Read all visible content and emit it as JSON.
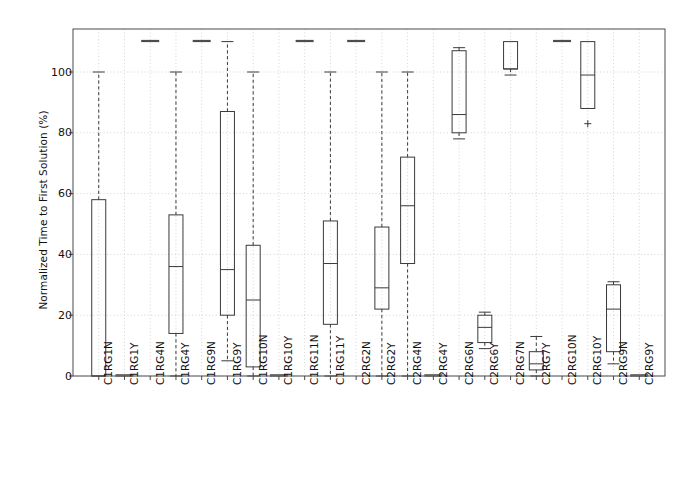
{
  "chart_data": {
    "type": "box",
    "title": "",
    "xlabel": "",
    "ylabel": "Normalized Time to First Solution (%)",
    "ylim": [
      -6,
      114
    ],
    "yticks": [
      0,
      20,
      40,
      60,
      80,
      100
    ],
    "ytick_labels": [
      "0",
      "20",
      "40",
      "60",
      "80",
      "100"
    ],
    "grid": true,
    "legend": "none",
    "categories": [
      "C1RG1N",
      "C1RG1Y",
      "C1RG4N",
      "C1RG4Y",
      "C1RG9N",
      "C1RG9Y",
      "C1RG10N",
      "C1RG10Y",
      "C1RG11N",
      "C1RG11Y",
      "C2RG2N",
      "C2RG2Y",
      "C2RG4N",
      "C2RG4Y",
      "C2RG6N",
      "C2RG6Y",
      "C2RG7N",
      "C2RG7Y",
      "C2RG10N",
      "C2RG10Y",
      "C2RG9N",
      "C2RG9Y"
    ],
    "boxes": [
      {
        "label": "C1RG1N",
        "whisker_low": 0,
        "q1": 0,
        "median": 0,
        "q3": 58,
        "whisker_high": 100,
        "fliers": []
      },
      {
        "label": "C1RG1Y",
        "whisker_low": 0,
        "q1": 0,
        "median": 0,
        "q3": 0,
        "whisker_high": 0,
        "fliers": []
      },
      {
        "label": "C1RG4N",
        "whisker_low": 110,
        "q1": 110,
        "median": 110,
        "q3": 110,
        "whisker_high": 110,
        "fliers": []
      },
      {
        "label": "C1RG4Y",
        "whisker_low": 0,
        "q1": 14,
        "median": 36,
        "q3": 53,
        "whisker_high": 100,
        "fliers": []
      },
      {
        "label": "C1RG9N",
        "whisker_low": 110,
        "q1": 110,
        "median": 110,
        "q3": 110,
        "whisker_high": 110,
        "fliers": []
      },
      {
        "label": "C1RG9Y",
        "whisker_low": 5,
        "q1": 20,
        "median": 35,
        "q3": 87,
        "whisker_high": 110,
        "fliers": []
      },
      {
        "label": "C1RG10N",
        "whisker_low": 0,
        "q1": 3,
        "median": 25,
        "q3": 43,
        "whisker_high": 100,
        "fliers": []
      },
      {
        "label": "C1RG10Y",
        "whisker_low": 0,
        "q1": 0,
        "median": 0,
        "q3": 0,
        "whisker_high": 0,
        "fliers": []
      },
      {
        "label": "C1RG11N",
        "whisker_low": 110,
        "q1": 110,
        "median": 110,
        "q3": 110,
        "whisker_high": 110,
        "fliers": []
      },
      {
        "label": "C1RG11Y",
        "whisker_low": 0,
        "q1": 17,
        "median": 37,
        "q3": 51,
        "whisker_high": 100,
        "fliers": []
      },
      {
        "label": "C2RG2N",
        "whisker_low": 110,
        "q1": 110,
        "median": 110,
        "q3": 110,
        "whisker_high": 110,
        "fliers": []
      },
      {
        "label": "C2RG2Y",
        "whisker_low": 0,
        "q1": 22,
        "median": 29,
        "q3": 49,
        "whisker_high": 100,
        "fliers": []
      },
      {
        "label": "C2RG4N",
        "whisker_low": 0,
        "q1": 37,
        "median": 56,
        "q3": 72,
        "whisker_high": 100,
        "fliers": []
      },
      {
        "label": "C2RG4Y",
        "whisker_low": 0,
        "q1": 0,
        "median": 0,
        "q3": 0,
        "whisker_high": 0,
        "fliers": []
      },
      {
        "label": "C2RG6N",
        "whisker_low": 78,
        "q1": 80,
        "median": 86,
        "q3": 107,
        "whisker_high": 108,
        "fliers": []
      },
      {
        "label": "C2RG6Y",
        "whisker_low": 9,
        "q1": 11,
        "median": 16,
        "q3": 20,
        "whisker_high": 21,
        "fliers": []
      },
      {
        "label": "C2RG7N",
        "whisker_low": 99,
        "q1": 101,
        "median": 101,
        "q3": 110,
        "whisker_high": 110,
        "fliers": []
      },
      {
        "label": "C2RG7Y",
        "whisker_low": 0,
        "q1": 2,
        "median": 4,
        "q3": 8,
        "whisker_high": 13,
        "fliers": []
      },
      {
        "label": "C2RG10N",
        "whisker_low": 110,
        "q1": 110,
        "median": 110,
        "q3": 110,
        "whisker_high": 110,
        "fliers": []
      },
      {
        "label": "C2RG10Y",
        "whisker_low": 88,
        "q1": 88,
        "median": 99,
        "q3": 110,
        "whisker_high": 110,
        "fliers": [
          83
        ]
      },
      {
        "label": "C2RG9N",
        "whisker_low": 4,
        "q1": 8,
        "median": 22,
        "q3": 30,
        "whisker_high": 31,
        "fliers": []
      },
      {
        "label": "C2RG9Y",
        "whisker_low": 0,
        "q1": 0,
        "median": 0,
        "q3": 0,
        "whisker_high": 0,
        "fliers": []
      }
    ],
    "colors": {
      "line": "#3a3a3a",
      "grid": "#c9c9c9",
      "spine": "#4a4a4a",
      "background": "#ffffff"
    }
  },
  "axes": {
    "ylabel": "Normalized Time to First Solution (%)"
  }
}
